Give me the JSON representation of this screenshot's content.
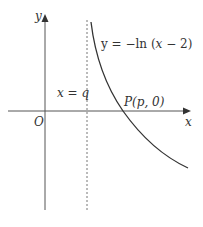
{
  "diagram": {
    "type": "graph-sketch",
    "curve": {
      "equation": "y = −ln (x − 2)",
      "label_parts": [
        "y = −ln (",
        "x",
        " − 2)"
      ]
    },
    "asymptote": {
      "label": "x = q",
      "var": "x",
      "eq": " = ",
      "val": "q"
    },
    "point": {
      "label": "P(p, 0)",
      "name": "P",
      "coords": "(p, 0)"
    },
    "axes": {
      "x_label": "x",
      "y_label": "y",
      "origin_label": "O"
    },
    "colors": {
      "line": "#333333",
      "dashed": "#777777",
      "background": "#ffffff"
    }
  }
}
